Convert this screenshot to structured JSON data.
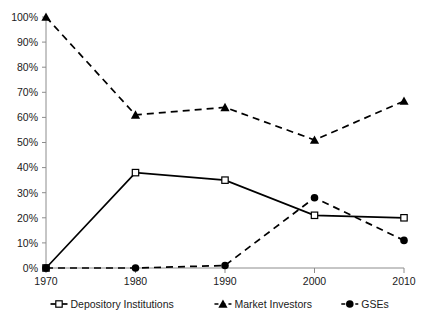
{
  "chart_data": {
    "type": "line",
    "title": "",
    "subtitle": "",
    "xlabel": "",
    "ylabel": "",
    "x": [
      1970,
      1980,
      1990,
      2000,
      2010
    ],
    "categories": [
      "1970",
      "1980",
      "1990",
      "2000",
      "2010"
    ],
    "xtick_labels": [
      "1970",
      "1980",
      "1990",
      "2000",
      "2010"
    ],
    "ytick_labels": [
      "0%",
      "10%",
      "20%",
      "30%",
      "40%",
      "50%",
      "60%",
      "70%",
      "80%",
      "90%",
      "100%"
    ],
    "ytick_values": [
      0,
      10,
      20,
      30,
      40,
      50,
      60,
      70,
      80,
      90,
      100
    ],
    "ylim": [
      0,
      100
    ],
    "xlim": [
      1970,
      2010
    ],
    "grid": false,
    "legend_position": "bottom",
    "series": [
      {
        "name": "Depository Institutions",
        "values": [
          0,
          38,
          35,
          21,
          20
        ],
        "marker": "open-square",
        "line_style": "solid",
        "color": "#000000"
      },
      {
        "name": "Market Investors",
        "values": [
          100,
          61,
          64,
          51,
          66.5
        ],
        "marker": "filled-triangle",
        "line_style": "dashed",
        "color": "#000000"
      },
      {
        "name": "GSEs",
        "values": [
          0,
          0,
          1,
          28,
          11
        ],
        "marker": "filled-circle",
        "line_style": "dashed",
        "color": "#000000"
      }
    ]
  },
  "legend": {
    "items": [
      {
        "label": "Depository Institutions"
      },
      {
        "label": "Market Investors"
      },
      {
        "label": "GSEs"
      }
    ]
  },
  "axes": {
    "y": {
      "labels": [
        "100%",
        "90%",
        "80%",
        "70%",
        "60%",
        "50%",
        "40%",
        "30%",
        "20%",
        "10%",
        "0%"
      ]
    },
    "x": {
      "labels": [
        "1970",
        "1980",
        "1990",
        "2000",
        "2010"
      ]
    }
  },
  "colors": {
    "line": "#000000",
    "axis": "#8c8c8c",
    "background": "#ffffff",
    "text": "#1a1a1a"
  }
}
